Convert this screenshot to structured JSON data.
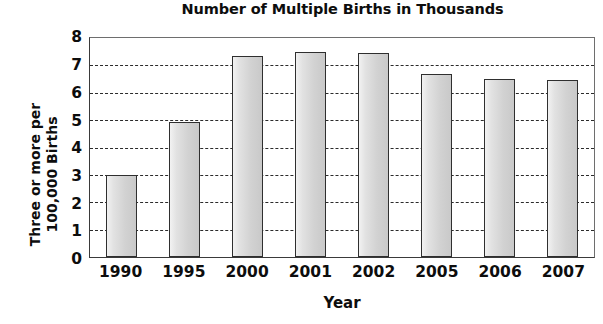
{
  "chart_data": {
    "type": "bar",
    "title": "Number of Multiple Births in Thousands",
    "xlabel": "Year",
    "ylabel": "Three or more per 100,000 Births",
    "ylabel_lines": [
      "Three or more per",
      "100,000 Births"
    ],
    "categories": [
      "1990",
      "1995",
      "2000",
      "2001",
      "2002",
      "2005",
      "2006",
      "2007"
    ],
    "values": [
      3.0,
      4.95,
      7.35,
      7.5,
      7.45,
      6.7,
      6.5,
      6.45
    ],
    "ylim": [
      0,
      8
    ],
    "ytick_labels": [
      "8",
      "7",
      "6",
      "5",
      "4",
      "3",
      "2",
      "1",
      "0"
    ],
    "ytick_values": [
      8,
      7,
      6,
      5,
      4,
      3,
      2,
      1,
      0
    ],
    "grid": "horizontal-dashed",
    "gridline_values": [
      7,
      6,
      5,
      4,
      3,
      2,
      1
    ],
    "legend": "none",
    "bar_fill_color": "#d9d9d9",
    "bar_border_color": "#2f2f2f",
    "plot_background": "#ffffff",
    "text_color": "#0d0d0d"
  }
}
